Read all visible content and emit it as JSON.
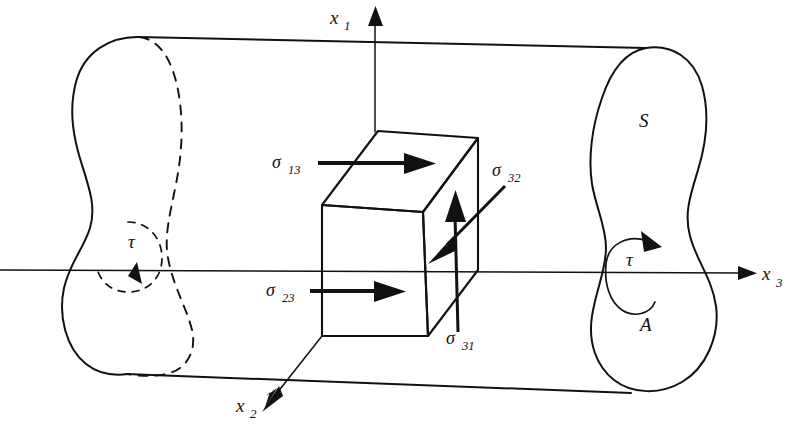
{
  "figure": {
    "background_color": "#ffffff",
    "ink_color": "#111111"
  },
  "axes": [
    {
      "name": "x1-axis",
      "symbol": "x",
      "subscript": "1",
      "direction": "up",
      "label_x": 330,
      "label_y": 24,
      "sub_x": 346,
      "sub_y": 30
    },
    {
      "name": "x2-axis",
      "symbol": "x",
      "subscript": "2",
      "direction": "down-left-front",
      "label_x": 236,
      "label_y": 412,
      "sub_x": 251,
      "sub_y": 418
    },
    {
      "name": "x3-axis",
      "symbol": "x",
      "subscript": "3",
      "direction": "right",
      "label_x": 760,
      "label_y": 280,
      "sub_x": 775,
      "sub_y": 286
    }
  ],
  "stress_labels": [
    {
      "name": "sigma-13",
      "symbol": "σ",
      "subscript": "13",
      "label_x": 272,
      "label_y": 168,
      "sub_x": 288,
      "sub_y": 174,
      "arrow_from": [
        318,
        163
      ],
      "arrow_to": [
        424,
        163
      ],
      "arrow_direction": "right"
    },
    {
      "name": "sigma-23",
      "symbol": "σ",
      "subscript": "23",
      "label_x": 268,
      "label_y": 296,
      "sub_x": 284,
      "sub_y": 302,
      "arrow_from": [
        312,
        291
      ],
      "arrow_to": [
        400,
        291
      ],
      "arrow_direction": "right"
    },
    {
      "name": "sigma-32",
      "symbol": "σ",
      "subscript": "32",
      "label_x": 492,
      "label_y": 176,
      "sub_x": 508,
      "sub_y": 182,
      "arrow_from": [
        505,
        186
      ],
      "arrow_to": [
        432,
        260
      ],
      "arrow_direction": "down-left"
    },
    {
      "name": "sigma-31",
      "symbol": "σ",
      "subscript": "31",
      "label_x": 446,
      "label_y": 344,
      "sub_x": 462,
      "sub_y": 350,
      "arrow_from": [
        458,
        332
      ],
      "arrow_to": [
        455,
        196
      ],
      "arrow_direction": "up"
    }
  ],
  "annotations": [
    {
      "name": "cross-section-label-S",
      "text": "S",
      "x": 639,
      "y": 127,
      "description": "Label for the lateral surface / cross-section boundary at the right end"
    },
    {
      "name": "area-label-A",
      "text": "A",
      "x": 640,
      "y": 330,
      "description": "Label for the cross-sectional area at the right end"
    },
    {
      "name": "torque-label-right",
      "text": "τ",
      "x": 628,
      "y": 266,
      "description": "Applied torque at the right end, shown with a solid circular arrow"
    },
    {
      "name": "torque-label-left",
      "text": "τ",
      "x": 131,
      "y": 248,
      "description": "Applied torque at the left end, shown with a dashed circular arrow"
    }
  ],
  "shapes": {
    "left_cross_section": {
      "name": "left-cross-section",
      "style": "solid left half, dashed hidden right half",
      "description": "Peanut / gourd shaped cross-section at the near-left end of the bar"
    },
    "right_cross_section": {
      "name": "right-cross-section",
      "style": "solid closed outline",
      "description": "Peanut / gourd shaped cross-section at the far-right end of the bar"
    },
    "cube": {
      "name": "stress-cube",
      "description": "Small cubic volume element at the origin with three visible faces"
    },
    "top_contour": {
      "name": "bar-top-contour",
      "from": [
        138,
        37
      ],
      "to": [
        646,
        48
      ]
    },
    "bottom_contour": {
      "name": "bar-bottom-contour",
      "from": [
        126,
        374
      ],
      "to": [
        631,
        393
      ]
    }
  }
}
